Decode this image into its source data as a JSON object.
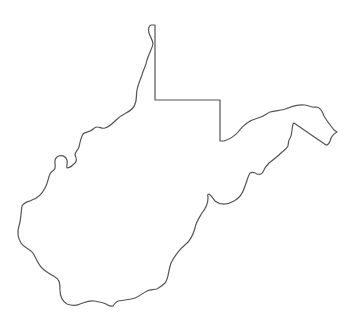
{
  "map": {
    "subject": "West Virginia state outline",
    "region_name": "West Virginia",
    "style": {
      "background": "#ffffff",
      "stroke": "#555555",
      "fill": "#ffffff"
    },
    "labels": []
  }
}
